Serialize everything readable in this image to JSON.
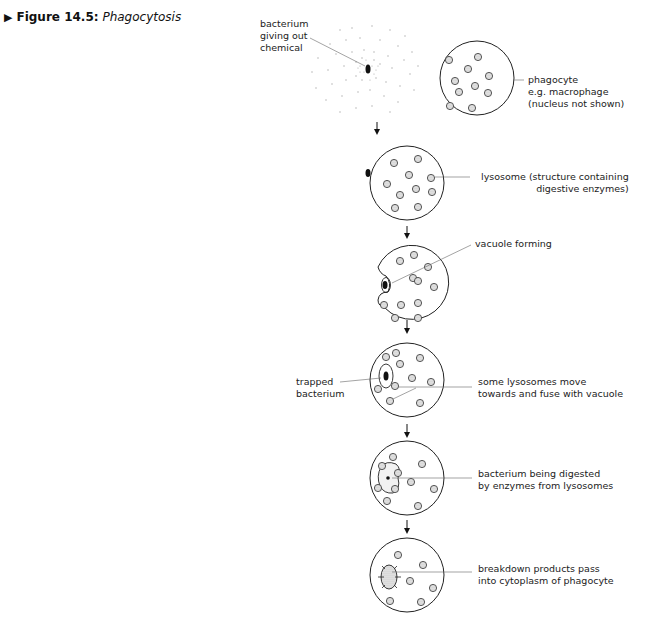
{
  "figure": {
    "marker": "▶",
    "number": "Figure 14.5:",
    "title": "Phagocytosis"
  },
  "stages": [
    {
      "id": "chemical",
      "labels": [
        "bacterium\ngiving out\nchemical",
        "phagocyte\ne.g. macrophage\n(nucleus not shown)"
      ]
    },
    {
      "id": "attach",
      "labels": [
        "lysosome (structure containing\ndigestive enzymes)"
      ]
    },
    {
      "id": "engulf",
      "labels": [
        "vacuole forming"
      ]
    },
    {
      "id": "trapped",
      "labels": [
        "trapped\nbacterium",
        "some lysosomes move\ntowards and fuse with vacuole"
      ]
    },
    {
      "id": "digest",
      "labels": [
        "bacterium being digested\nby enzymes from lysosomes"
      ]
    },
    {
      "id": "absorb",
      "labels": [
        "breakdown products pass\ninto cytoplasm of phagocyte"
      ]
    }
  ],
  "colors": {
    "ink": "#222222",
    "line": "#555555",
    "lysosome_fill": "#d8d8d8",
    "dots": "#999999"
  }
}
